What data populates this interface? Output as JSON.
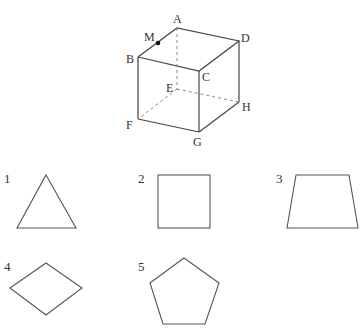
{
  "cube": {
    "vertices": {
      "A": "A",
      "B": "B",
      "C": "C",
      "D": "D",
      "E": "E",
      "F": "F",
      "G": "G",
      "H": "H"
    },
    "point": "M",
    "hidden_edges": [
      "AE",
      "EF",
      "EH"
    ]
  },
  "options": [
    {
      "number": "1",
      "shape": "triangle"
    },
    {
      "number": "2",
      "shape": "square"
    },
    {
      "number": "3",
      "shape": "trapezoid"
    },
    {
      "number": "4",
      "shape": "rhombus"
    },
    {
      "number": "5",
      "shape": "pentagon"
    }
  ]
}
